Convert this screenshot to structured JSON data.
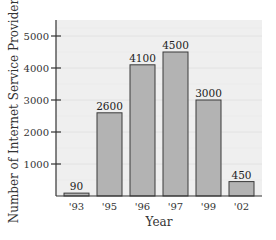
{
  "chart_data": {
    "type": "bar",
    "title": "",
    "xlabel": "Year",
    "ylabel": "Number of Internet Service Providers",
    "categories": [
      "'93",
      "'95",
      "'96",
      "'97",
      "'99",
      "'02"
    ],
    "values": [
      90,
      2600,
      4100,
      4500,
      3000,
      450
    ],
    "data_labels": [
      "90",
      "2600",
      "4100",
      "4500",
      "3000",
      "450"
    ],
    "yticks": [
      1000,
      2000,
      3000,
      4000,
      5000
    ],
    "ytick_labels": [
      "1000",
      "2000",
      "3000",
      "4000",
      "5000"
    ],
    "ylim": [
      0,
      5500
    ],
    "grid": true,
    "legend": null
  },
  "colors": {
    "bar_fill": "#b3b3b3",
    "bar_stroke": "#3a3a3a",
    "plot_bg": "#efefef",
    "grid": "#e2e2e2",
    "axis": "#333333"
  }
}
